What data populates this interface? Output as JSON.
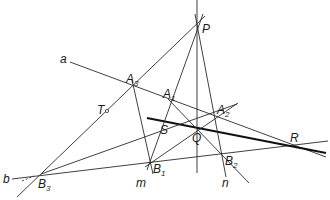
{
  "diagram": {
    "type": "projective-geometry-construction",
    "points": [
      {
        "id": "P",
        "label": "P",
        "sub": "",
        "x": 197,
        "y": 27
      },
      {
        "id": "A1",
        "label": "A",
        "sub": "1",
        "x": 171,
        "y": 102
      },
      {
        "id": "A2",
        "label": "A",
        "sub": "2",
        "x": 216,
        "y": 116
      },
      {
        "id": "A3",
        "label": "A",
        "sub": "3",
        "x": 134,
        "y": 88
      },
      {
        "id": "B1",
        "label": "B",
        "sub": "1",
        "x": 150,
        "y": 162
      },
      {
        "id": "B2",
        "label": "B",
        "sub": "2",
        "x": 223,
        "y": 155
      },
      {
        "id": "B3",
        "label": "B",
        "sub": "3",
        "x": 41,
        "y": 174
      },
      {
        "id": "Q",
        "label": "Q",
        "sub": "",
        "x": 197,
        "y": 130
      },
      {
        "id": "R",
        "label": "R",
        "sub": "",
        "x": 291,
        "y": 145
      },
      {
        "id": "S",
        "label": "S",
        "sub": "",
        "x": 163,
        "y": 121
      },
      {
        "id": "T",
        "label": "T",
        "sub": "",
        "x": 107,
        "y": 111
      }
    ],
    "line_labels": [
      {
        "id": "a",
        "label": "a"
      },
      {
        "id": "b",
        "label": "b"
      },
      {
        "id": "m",
        "label": "m"
      },
      {
        "id": "n",
        "label": "n"
      }
    ]
  }
}
